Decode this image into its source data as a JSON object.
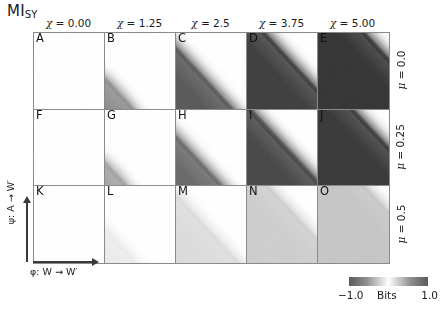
{
  "figure": {
    "title_main": "MI",
    "title_sub": "SY",
    "xlabel": "φ: W → W′",
    "ylabel": "ψ: A → W′"
  },
  "columns": [
    {
      "label": "χ = 0.00",
      "chi": 0.0
    },
    {
      "label": "χ = 1.25",
      "chi": 1.25
    },
    {
      "label": "χ = 2.5",
      "chi": 2.5
    },
    {
      "label": "χ = 3.75",
      "chi": 3.75
    },
    {
      "label": "χ = 5.00",
      "chi": 5.0
    }
  ],
  "rows": [
    {
      "label": "μ = 0.0",
      "mu": 0.0
    },
    {
      "label": "μ = 0.25",
      "mu": 0.25
    },
    {
      "label": "μ = 0.5",
      "mu": 0.5
    }
  ],
  "colorbar": {
    "label": "Bits",
    "min_label": "−1.0",
    "max_label": "1.0",
    "vmin": -1.0,
    "vmax": 1.0,
    "colormap": "dark-white-dark (diverging, white at 0)",
    "end_color": "#5a5a5a",
    "center_color": "#ffffff"
  },
  "chart_data": {
    "type": "heatmap",
    "xlabel": "φ: W → W′",
    "ylabel": "ψ: A → W′",
    "zlabel": "Bits",
    "zlim": [
      -1.0,
      1.0
    ],
    "grid": false,
    "legend": "colorbar-bottom-right",
    "col_variable": "χ",
    "row_variable": "μ",
    "col_values": [
      0.0,
      1.25,
      2.5,
      3.75,
      5.0
    ],
    "row_values": [
      0.0,
      0.25,
      0.5
    ],
    "panels": [
      {
        "letter": "A",
        "chi": 0.0,
        "mu": 0.0,
        "peak_bits": 0.02,
        "band_extent": 0.0,
        "band_darkness": 0.02,
        "description": "essentially uniform white, no structure"
      },
      {
        "letter": "B",
        "chi": 1.25,
        "mu": 0.0,
        "peak_bits": -0.55,
        "band_extent": 0.18,
        "band_darkness": 0.55,
        "description": "small dark blob in lower-left corner"
      },
      {
        "letter": "C",
        "chi": 2.5,
        "mu": 0.0,
        "peak_bits": -0.8,
        "band_extent": 0.38,
        "band_darkness": 0.8,
        "description": "dark wedge along lower-left anti-diagonal"
      },
      {
        "letter": "D",
        "chi": 3.75,
        "mu": 0.0,
        "peak_bits": -0.92,
        "band_extent": 0.6,
        "band_darkness": 0.92,
        "description": "large dark triangle below anti-diagonal with soft white rim"
      },
      {
        "letter": "E",
        "chi": 5.0,
        "mu": 0.0,
        "peak_bits": -0.97,
        "band_extent": 0.8,
        "band_darkness": 0.97,
        "description": "dark region fills most of panel up to the anti-diagonal"
      },
      {
        "letter": "F",
        "chi": 0.0,
        "mu": 0.25,
        "peak_bits": 0.02,
        "band_extent": 0.0,
        "band_darkness": 0.02,
        "description": "uniform white"
      },
      {
        "letter": "G",
        "chi": 1.25,
        "mu": 0.25,
        "peak_bits": -0.45,
        "band_extent": 0.13,
        "band_darkness": 0.45,
        "description": "tiny dark spot at lower-left corner"
      },
      {
        "letter": "H",
        "chi": 2.5,
        "mu": 0.25,
        "peak_bits": -0.72,
        "band_extent": 0.3,
        "band_darkness": 0.72,
        "description": "dark wedge, smaller than C"
      },
      {
        "letter": "I",
        "chi": 3.75,
        "mu": 0.25,
        "peak_bits": -0.88,
        "band_extent": 0.5,
        "band_darkness": 0.88,
        "description": "dark triangle with white diagonal stripe"
      },
      {
        "letter": "J",
        "chi": 5.0,
        "mu": 0.25,
        "peak_bits": -0.95,
        "band_extent": 0.72,
        "band_darkness": 0.95,
        "description": "large dark triangle, bright diagonal band separating it"
      },
      {
        "letter": "K",
        "chi": 0.0,
        "mu": 0.5,
        "peak_bits": 0.01,
        "band_extent": 0.0,
        "band_darkness": 0.01,
        "description": "uniform white"
      },
      {
        "letter": "L",
        "chi": 1.25,
        "mu": 0.5,
        "peak_bits": -0.12,
        "band_extent": 0.2,
        "band_darkness": 0.1,
        "description": "very faint gray tint lower-left"
      },
      {
        "letter": "M",
        "chi": 2.5,
        "mu": 0.5,
        "peak_bits": -0.2,
        "band_extent": 0.42,
        "band_darkness": 0.17,
        "description": "light gray diagonal band lower-left"
      },
      {
        "letter": "N",
        "chi": 3.75,
        "mu": 0.5,
        "peak_bits": -0.28,
        "band_extent": 0.62,
        "band_darkness": 0.24,
        "description": "light gray triangle with pale diagonal stripe"
      },
      {
        "letter": "O",
        "chi": 5.0,
        "mu": 0.5,
        "peak_bits": -0.33,
        "band_extent": 0.8,
        "band_darkness": 0.28,
        "description": "light gray region covering most of the panel"
      }
    ]
  }
}
